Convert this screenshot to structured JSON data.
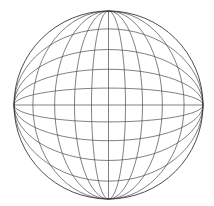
{
  "diagram": {
    "type": "wireframe-sphere",
    "center": {
      "x": 108.5,
      "y": 105
    },
    "radius": {
      "x": 94.5,
      "y": 94
    },
    "meridian_ratios": [
      0.18,
      0.36,
      0.57,
      0.8
    ],
    "parallel_ratios": [
      0.18,
      0.38,
      0.59,
      0.81
    ],
    "stroke_color": "#4a4a4a",
    "outline_color": "#3a3a3a",
    "background": "#ffffff"
  }
}
